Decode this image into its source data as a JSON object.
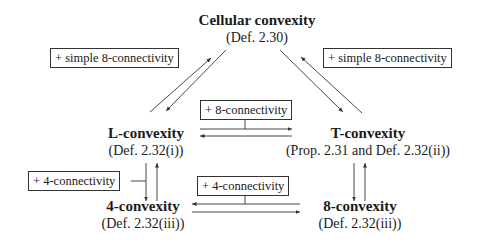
{
  "nodes": {
    "cellular": {
      "title": "Cellular convexity",
      "ref": "(Def. 2.30)"
    },
    "l": {
      "title": "L-convexity",
      "ref": "(Def. 2.32(i))"
    },
    "t": {
      "title": "T-convexity",
      "ref": "(Prop. 2.31 and Def. 2.32(ii))"
    },
    "four": {
      "title": "4-convexity",
      "ref": "(Def. 2.32(iii))"
    },
    "eight": {
      "title": "8-convexity",
      "ref": "(Def. 2.32(iii))"
    }
  },
  "edge_labels": {
    "cellular_l": "+ simple 8-connectivity",
    "cellular_t": "+ simple 8-connectivity",
    "l_t": "+ 8-connectivity",
    "l_four": "+ 4-connectivity",
    "four_eight": "+ 4-connectivity"
  },
  "colors": {
    "line": "#333333",
    "text": "#1a1a1a"
  }
}
